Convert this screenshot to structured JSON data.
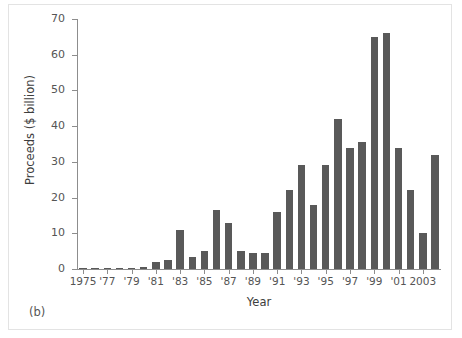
{
  "figure": {
    "panel_label": "(b)",
    "background": "#ffffff",
    "bar_color": "#595959",
    "axis_color": "#8d8d8d",
    "text_color": "#555555"
  },
  "chart_data": {
    "type": "bar",
    "title": "",
    "subtitle": "",
    "xlabel": "Year",
    "ylabel": "Proceeds ($ billion)",
    "ylim": [
      0,
      70
    ],
    "ytick_values": [
      0,
      10,
      20,
      30,
      40,
      50,
      60,
      70
    ],
    "ytick_labels": [
      "0",
      "10",
      "20",
      "30",
      "40",
      "50",
      "60",
      "70"
    ],
    "grid": false,
    "legend": "none",
    "categories": [
      "1975",
      "1976",
      "1977",
      "1978",
      "1979",
      "1980",
      "1981",
      "1982",
      "1983",
      "1984",
      "1985",
      "1986",
      "1987",
      "1988",
      "1989",
      "1990",
      "1991",
      "1992",
      "1993",
      "1994",
      "1995",
      "1996",
      "1997",
      "1998",
      "1999",
      "2000",
      "2001",
      "2002",
      "2003",
      "2004"
    ],
    "values": [
      0.2,
      0.3,
      0.3,
      0.3,
      0.4,
      0.5,
      2.0,
      2.5,
      11.0,
      3.5,
      5.0,
      16.5,
      13.0,
      5.0,
      4.5,
      4.5,
      16.0,
      22.0,
      29.0,
      18.0,
      29.0,
      42.0,
      34.0,
      35.5,
      65.0,
      66.0,
      34.0,
      22.0,
      10.0,
      32.0
    ],
    "xtick_labels": [
      "1975",
      "'77",
      "'79",
      "'81",
      "'83",
      "'85",
      "'87",
      "'89",
      "'91",
      "'93",
      "'95",
      "'97",
      "'99",
      "'01",
      "2003"
    ],
    "xtick_categories": [
      "1975",
      "1977",
      "1979",
      "1981",
      "1983",
      "1985",
      "1987",
      "1989",
      "1991",
      "1993",
      "1995",
      "1997",
      "1999",
      "2001",
      "2003"
    ]
  }
}
